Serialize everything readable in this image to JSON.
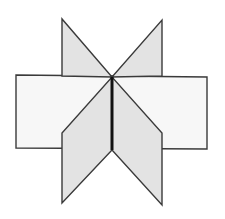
{
  "diagram": {
    "colors": {
      "background": "#ffffff",
      "light_fill": "#f7f7f7",
      "shaded_fill": "#e3e3e3",
      "stroke": "#3a3a3a",
      "crease": "#111111"
    },
    "shapes": [
      {
        "name": "rectangle",
        "points": "16,75 207,77 207,149 16,148"
      },
      {
        "name": "triangle-top-left",
        "points": "62,19 62,76 112,77"
      },
      {
        "name": "triangle-top-right",
        "points": "162,20 162,76 112,77"
      },
      {
        "name": "parallelogram-bottom-left",
        "points": "112,77 112,150 62,203 62,133"
      },
      {
        "name": "parallelogram-bottom-right",
        "points": "112,77 112,150 162,205 162,133"
      }
    ],
    "crease": {
      "x1": 112,
      "y1": 77,
      "x2": 112,
      "y2": 150
    }
  }
}
